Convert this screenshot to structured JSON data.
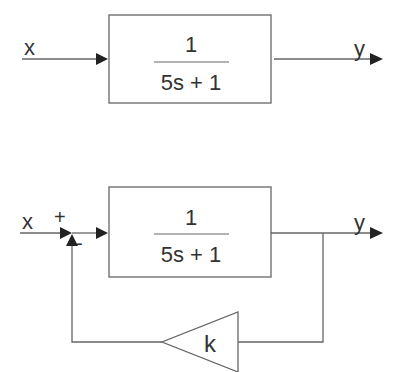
{
  "open_loop": {
    "input_label": "x",
    "output_label": "y",
    "block": {
      "numerator": "1",
      "denominator": "5s + 1"
    }
  },
  "closed_loop": {
    "input_label": "x",
    "output_label": "y",
    "plus_sign": "+",
    "minus_sign": "-",
    "block": {
      "numerator": "1",
      "denominator": "5s + 1"
    },
    "feedback_gain": "k"
  },
  "colors": {
    "stroke": "#666666",
    "text": "#333333",
    "arrow": "#222222"
  }
}
